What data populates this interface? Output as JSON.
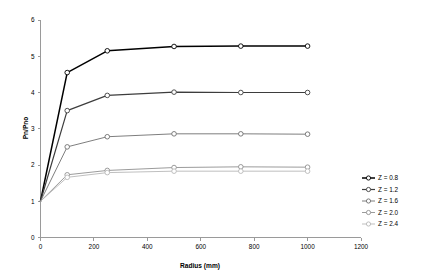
{
  "chart_data": {
    "type": "line",
    "title": "",
    "xlabel": "Radius (mm)",
    "ylabel": "Pn/Pno",
    "xlim": [
      0,
      1200
    ],
    "ylim": [
      0,
      6
    ],
    "xticks": [
      0,
      200,
      400,
      600,
      800,
      1000,
      1200
    ],
    "yticks": [
      0,
      1,
      2,
      3,
      4,
      5,
      6
    ],
    "xtick_labels": [
      "0",
      "200",
      "400",
      "600",
      "800",
      "1000",
      "1200"
    ],
    "ytick_labels": [
      "0",
      "1",
      "2",
      "3",
      "4",
      "5",
      "6"
    ],
    "grid": false,
    "legend_position": "right",
    "x": [
      0,
      100,
      250,
      500,
      750,
      1000
    ],
    "series": [
      {
        "name": "Z = 0.8",
        "color": "#000000",
        "marker": "circle",
        "values": [
          1.0,
          4.55,
          5.15,
          5.27,
          5.28,
          5.28
        ]
      },
      {
        "name": "Z = 1.2",
        "color": "#3d3d3d",
        "marker": "circle",
        "values": [
          1.0,
          3.5,
          3.92,
          4.01,
          4.0,
          4.0
        ]
      },
      {
        "name": "Z = 1.6",
        "color": "#6f6f6f",
        "marker": "circle",
        "values": [
          1.0,
          2.5,
          2.78,
          2.86,
          2.86,
          2.85
        ]
      },
      {
        "name": "Z = 2.0",
        "color": "#909090",
        "marker": "circle",
        "values": [
          1.0,
          1.73,
          1.85,
          1.93,
          1.95,
          1.94
        ]
      },
      {
        "name": "Z = 2.4",
        "color": "#b8b8b8",
        "marker": "circle",
        "values": [
          1.0,
          1.66,
          1.79,
          1.83,
          1.83,
          1.83
        ]
      }
    ]
  },
  "axes": {
    "x_title": "Radius (mm)",
    "y_title": "Pn/Pno"
  },
  "legend": {
    "entries": [
      {
        "label": "Z = 0.8"
      },
      {
        "label": "Z = 1.2"
      },
      {
        "label": "Z = 1.6"
      },
      {
        "label": "Z = 2.0"
      },
      {
        "label": "Z = 2.4"
      }
    ]
  }
}
